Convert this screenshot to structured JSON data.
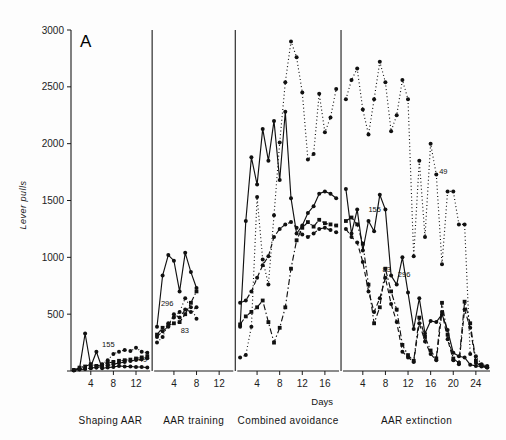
{
  "figure": {
    "panel_letter": "A",
    "background": "#fdfdfd",
    "axis_color": "#1a1a1a"
  },
  "chart_data": {
    "type": "line",
    "title": "",
    "panel_letter": "A",
    "xlabel": "Days",
    "ylabel": "Lever pulls",
    "ylim": [
      0,
      3000
    ],
    "ytick_values": [
      0,
      500,
      1000,
      1500,
      2000,
      2500,
      3000
    ],
    "ytick_labels": [
      "",
      "500",
      "1000",
      "1500",
      "2000",
      "2500",
      "3000"
    ],
    "grid": false,
    "legend_position": "inline-labels",
    "phases": [
      {
        "name": "Shaping AAR",
        "days": 14,
        "xticks": [
          4,
          8,
          12
        ]
      },
      {
        "name": "AAR training",
        "days": 14,
        "xticks": [
          4,
          8,
          12
        ]
      },
      {
        "name": "Combined avoidance",
        "days": 18,
        "xticks": [
          4,
          8,
          12,
          16
        ]
      },
      {
        "name": "AAR extinction",
        "days": 26,
        "xticks": [
          4,
          8,
          12,
          16,
          20,
          24
        ]
      }
    ],
    "series": [
      {
        "name": "155",
        "line_style": "solid",
        "marker": "filled-circle",
        "color": "#111111",
        "phase_values": {
          "Shaping AAR": [
            5,
            20,
            330,
            40,
            170,
            25,
            30,
            35,
            45,
            40,
            40,
            35,
            35,
            30
          ],
          "AAR training": [
            390,
            840,
            1020,
            970,
            700,
            1040,
            870,
            730
          ],
          "Combined avoidance": [
            390,
            1320,
            1880,
            1640,
            2130,
            1850,
            2200,
            1680,
            2280,
            1520,
            1210,
            1280,
            1390,
            1450,
            1560,
            1580,
            1560,
            1520
          ],
          "AAR extinction": [
            1600,
            1210,
            1420,
            1060,
            1320,
            1230,
            1550,
            1420,
            840,
            760,
            1000,
            690,
            370,
            640,
            330,
            440,
            430,
            500,
            360,
            160,
            130,
            120,
            55,
            45,
            40,
            30
          ]
        }
      },
      {
        "name": "49",
        "line_style": "dotted",
        "marker": "filled-circle",
        "color": "#111111",
        "phase_values": {
          "Shaping AAR": [
            10,
            15,
            20,
            25,
            30,
            60,
            95,
            150,
            170,
            185,
            175,
            205,
            170,
            160
          ],
          "AAR training": [
            250,
            300,
            420,
            470,
            520,
            640,
            560,
            460
          ],
          "Combined avoidance": [
            120,
            140,
            390,
            1530,
            980,
            760,
            1370,
            2010,
            2540,
            2900,
            2760,
            2450,
            1860,
            1910,
            2440,
            2100,
            2230,
            2480
          ],
          "AAR extinction": [
            2390,
            2560,
            2660,
            2300,
            2080,
            2390,
            2720,
            2540,
            2110,
            2250,
            2560,
            2390,
            1010,
            1850,
            1180,
            2000,
            1730,
            940,
            1580,
            1580,
            1290,
            1290,
            150,
            130,
            60,
            45
          ]
        }
      },
      {
        "name": "296",
        "line_style": "dash-dot",
        "marker": "filled-square",
        "color": "#111111",
        "phase_values": {
          "Shaping AAR": [
            8,
            30,
            40,
            60,
            45,
            55,
            70,
            80,
            90,
            95,
            100,
            110,
            120,
            130
          ],
          "AAR training": [
            320,
            380,
            400,
            420,
            430,
            500,
            600,
            700
          ],
          "Combined avoidance": [
            410,
            480,
            520,
            560,
            620,
            430,
            250,
            380,
            560,
            900,
            1150,
            1260,
            1310,
            1270,
            1330,
            1300,
            1290,
            1280
          ],
          "AAR extinction": [
            1320,
            1350,
            1290,
            1120,
            760,
            420,
            560,
            900,
            700,
            540,
            230,
            140,
            90,
            470,
            300,
            180,
            110,
            600,
            320,
            110,
            70,
            610,
            420,
            90,
            50,
            35
          ]
        }
      },
      {
        "name": "83",
        "line_style": "dashed",
        "marker": "filled-circle",
        "color": "#111111",
        "phase_values": {
          "Shaping AAR": [
            6,
            12,
            18,
            26,
            32,
            38,
            48,
            60,
            70,
            78,
            88,
            96,
            104,
            112
          ],
          "AAR training": [
            300,
            350,
            390,
            500,
            470,
            540,
            520,
            560
          ],
          "Combined avoidance": [
            600,
            620,
            700,
            820,
            930,
            1010,
            1180,
            1250,
            1290,
            1310,
            1260,
            1200,
            1180,
            1210,
            1250,
            1260,
            1240,
            1220
          ],
          "AAR extinction": [
            1250,
            1180,
            1130,
            960,
            700,
            520,
            640,
            820,
            590,
            430,
            170,
            120,
            80,
            420,
            260,
            150,
            95,
            520,
            280,
            95,
            60,
            540,
            380,
            70,
            45,
            30
          ]
        }
      }
    ],
    "inline_annotations": [
      {
        "text": "155",
        "phase": "Shaping AAR",
        "approx_x_day": 5.0,
        "approx_y": 210
      },
      {
        "text": "49",
        "phase": "Shaping AAR",
        "approx_x_day": 11.5,
        "approx_y": 75
      },
      {
        "text": "296",
        "phase": "AAR training",
        "approx_x_day": 0.7,
        "approx_y": 570
      },
      {
        "text": "83",
        "phase": "AAR training",
        "approx_x_day": 4.2,
        "approx_y": 330
      },
      {
        "text": "155",
        "phase": "AAR extinction",
        "approx_x_day": 4.0,
        "approx_y": 1400
      },
      {
        "text": "49",
        "phase": "AAR extinction",
        "approx_x_day": 16.5,
        "approx_y": 1730
      },
      {
        "text": "83",
        "phase": "AAR extinction",
        "approx_x_day": 6.5,
        "approx_y": 870
      },
      {
        "text": "296",
        "phase": "AAR extinction",
        "approx_x_day": 9.2,
        "approx_y": 830
      }
    ]
  }
}
